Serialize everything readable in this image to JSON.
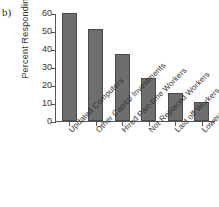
{
  "panel": {
    "label": "b)"
  },
  "bleed": {
    "left": "",
    "right": ""
  },
  "chart_data": {
    "type": "bar",
    "title": "",
    "xlabel": "",
    "ylabel": "Percent Responding",
    "ylim": [
      0,
      60
    ],
    "yticks": [
      0,
      10,
      20,
      30,
      40,
      50,
      60
    ],
    "ytick_labels": [
      "0",
      "10",
      "20",
      "30",
      "40",
      "50",
      "60"
    ],
    "grid": false,
    "legend": null,
    "bar_color": "#6e6e6e",
    "bar_edge_color": "#4a4a4a",
    "axis_color": "#555555",
    "categories": [
      "Updated Computers",
      "Other Capital Investments",
      "Hired Part-time Workers",
      "Not Replaced Workers",
      "Laid off Workers",
      "Lowered Salaries"
    ],
    "values": [
      60,
      51,
      37,
      24,
      15.5,
      10.5
    ]
  }
}
